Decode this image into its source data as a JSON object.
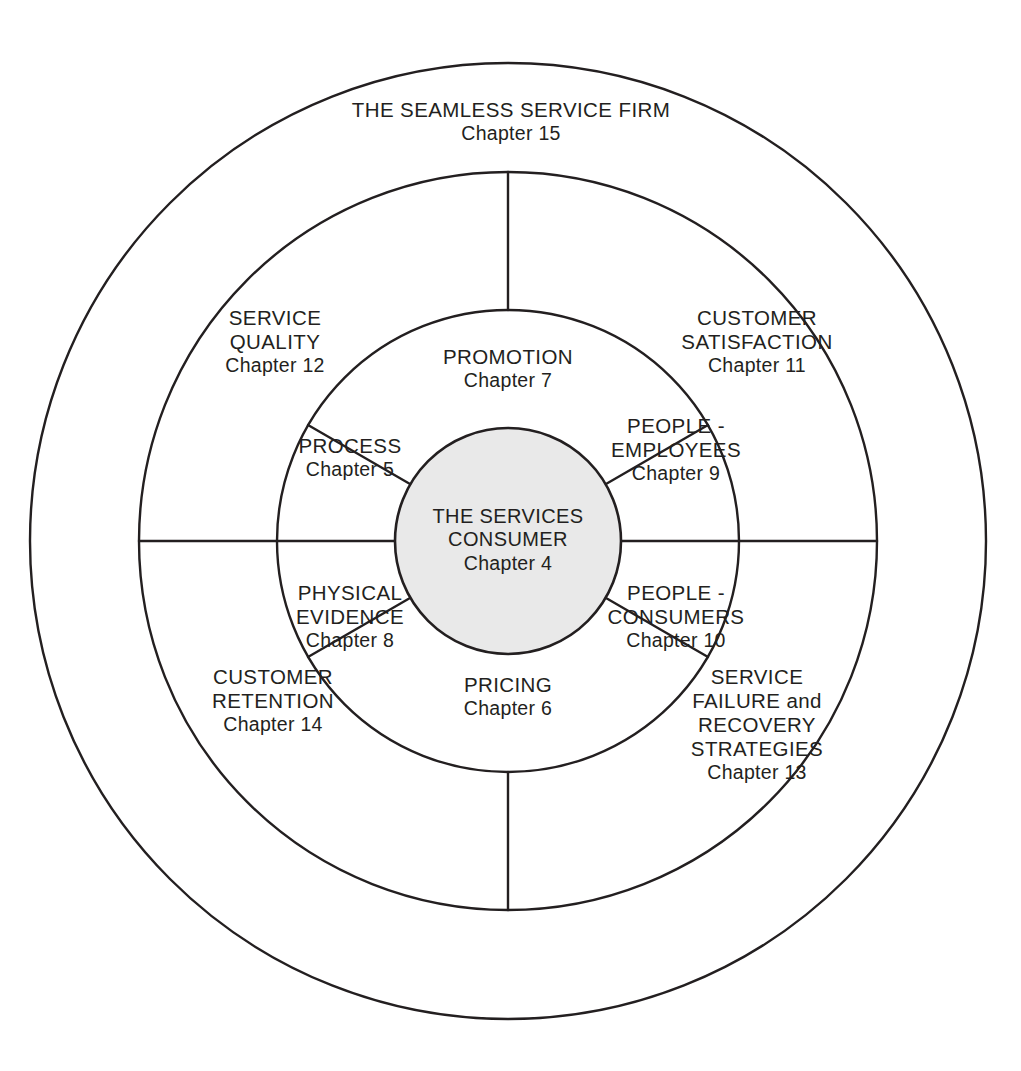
{
  "diagram": {
    "colors": {
      "stroke": "#231f20",
      "core_fill": "#e9e9e9",
      "background": "#ffffff",
      "text": "#231f20"
    },
    "geometry": {
      "center_x": 508,
      "center_y": 541,
      "outer_radius": 478,
      "middle_radius": 369,
      "inner_radius": 231,
      "core_radius": 113
    },
    "outer_ring": {
      "title": "THE SEAMLESS SERVICE FIRM",
      "chapter": "Chapter 15"
    },
    "middle_ring": [
      {
        "position": "upper-left",
        "lines": [
          "SERVICE",
          "QUALITY"
        ],
        "chapter": "Chapter 12"
      },
      {
        "position": "upper-right",
        "lines": [
          "CUSTOMER",
          "SATISFACTION"
        ],
        "chapter": "Chapter 11"
      },
      {
        "position": "lower-left",
        "lines": [
          "CUSTOMER",
          "RETENTION"
        ],
        "chapter": "Chapter 14"
      },
      {
        "position": "lower-right",
        "lines": [
          "SERVICE",
          "FAILURE and",
          "RECOVERY",
          "STRATEGIES"
        ],
        "chapter": "Chapter 13"
      }
    ],
    "inner_ring": [
      {
        "position": "top",
        "lines": [
          "PROMOTION"
        ],
        "chapter": "Chapter 7"
      },
      {
        "position": "upper-left",
        "lines": [
          "PROCESS"
        ],
        "chapter": "Chapter 5"
      },
      {
        "position": "upper-right",
        "lines": [
          "PEOPLE -",
          "EMPLOYEES"
        ],
        "chapter": "Chapter 9"
      },
      {
        "position": "lower-left",
        "lines": [
          "PHYSICAL",
          "EVIDENCE"
        ],
        "chapter": "Chapter 8"
      },
      {
        "position": "lower-right",
        "lines": [
          "PEOPLE -",
          "CONSUMERS"
        ],
        "chapter": "Chapter 10"
      },
      {
        "position": "bottom",
        "lines": [
          "PRICING"
        ],
        "chapter": "Chapter 6"
      }
    ],
    "core": {
      "lines": [
        "THE SERVICES",
        "CONSUMER"
      ],
      "chapter": "Chapter 4"
    }
  }
}
